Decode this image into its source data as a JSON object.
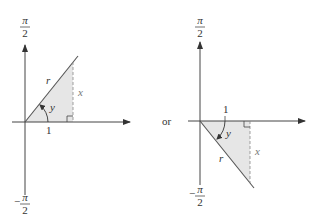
{
  "connector": "or",
  "colors": {
    "axis": "#444444",
    "shade": "#e6e6e6",
    "dashed": "#888888",
    "text": "#333333"
  },
  "left_diagram": {
    "top_label_num": "π",
    "top_label_den": "2",
    "bottom_label_sign": "−",
    "bottom_label_num": "π",
    "bottom_label_den": "2",
    "hypotenuse_label": "r",
    "opposite_label": "x",
    "angle_label": "y",
    "adjacent_label": "1"
  },
  "right_diagram": {
    "top_label_num": "π",
    "top_label_den": "2",
    "bottom_label_sign": "−",
    "bottom_label_num": "π",
    "bottom_label_den": "2",
    "hypotenuse_label": "r",
    "opposite_label": "x",
    "angle_label": "y",
    "adjacent_label": "1"
  }
}
